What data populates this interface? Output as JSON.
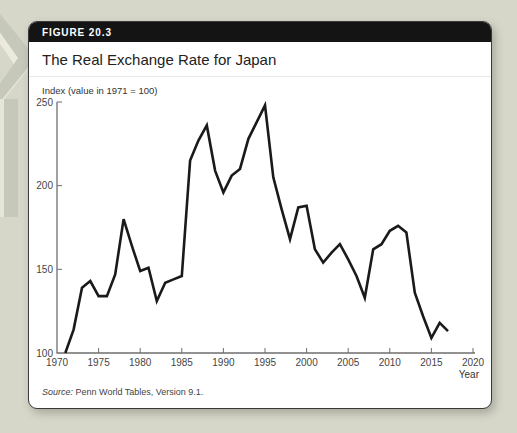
{
  "page": {
    "background": "#d6d7c9"
  },
  "figure": {
    "label": "FIGURE 20.3",
    "title": "The Real Exchange Rate for Japan"
  },
  "chart_data": {
    "type": "line",
    "title": "The Real Exchange Rate for Japan",
    "ylabel": "Index (value in 1971 = 100)",
    "xlabel": "Year",
    "xlim": [
      1970,
      2020
    ],
    "ylim": [
      100,
      250
    ],
    "x_ticks": [
      1970,
      1975,
      1980,
      1985,
      1990,
      1995,
      2000,
      2005,
      2010,
      2015,
      2020
    ],
    "y_ticks": [
      100,
      150,
      200,
      250
    ],
    "grid": false,
    "line_color": "#1a1a1a",
    "x": [
      1971,
      1972,
      1973,
      1974,
      1975,
      1976,
      1977,
      1978,
      1979,
      1980,
      1981,
      1982,
      1983,
      1984,
      1985,
      1986,
      1987,
      1988,
      1989,
      1990,
      1991,
      1992,
      1993,
      1994,
      1995,
      1996,
      1997,
      1998,
      1999,
      2000,
      2001,
      2002,
      2003,
      2004,
      2005,
      2006,
      2007,
      2008,
      2009,
      2010,
      2011,
      2012,
      2013,
      2014,
      2015,
      2016,
      2017
    ],
    "y": [
      100,
      114,
      139,
      143,
      134,
      134,
      147,
      180,
      164,
      149,
      151,
      131,
      142,
      144,
      146,
      215,
      227,
      236,
      209,
      196,
      206,
      210,
      228,
      238,
      248,
      205,
      186,
      168,
      187,
      188,
      162,
      154,
      160,
      165,
      156,
      146,
      133,
      162,
      165,
      173,
      176,
      172,
      136,
      122,
      109,
      118,
      113
    ]
  },
  "source": {
    "prefix": "Source:",
    "text": " Penn World Tables, Version 9.1."
  }
}
